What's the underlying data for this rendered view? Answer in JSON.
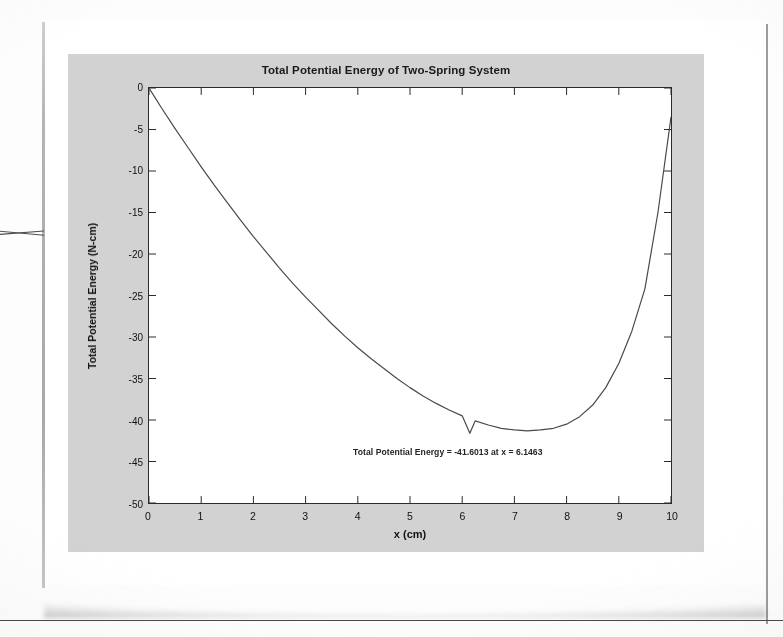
{
  "document": {
    "kind": "scanned-page-figure",
    "page_background": "#ffffff",
    "figure_background": "#d2d2d2",
    "axes_background": "#ffffff",
    "ink_color": "#2b2b2b"
  },
  "figure": {
    "title": "Total Potential Energy of Two-Spring System",
    "xlabel": "x (cm)",
    "ylabel": "Total Potential Energy (N-cm)",
    "annotation": "Total Potential Energy = -41.6013 at x = 6.1463"
  },
  "chart_data": {
    "type": "line",
    "title": "Total Potential Energy of Two-Spring System",
    "xlabel": "x (cm)",
    "ylabel": "Total Potential Energy (N-cm)",
    "xlim": [
      0,
      10
    ],
    "ylim": [
      -50,
      0
    ],
    "xticks": [
      0,
      1,
      2,
      3,
      4,
      5,
      6,
      7,
      8,
      9,
      10
    ],
    "xticklabels": [
      "0",
      "1",
      "2",
      "3",
      "4",
      "5",
      "6",
      "7",
      "8",
      "9",
      "10"
    ],
    "yticks": [
      0,
      -5,
      -10,
      -15,
      -20,
      -25,
      -30,
      -35,
      -40,
      -45,
      -50
    ],
    "yticklabels": [
      "0",
      "-5",
      "-10",
      "-15",
      "-20",
      "-25",
      "-30",
      "-35",
      "-40",
      "-45",
      "-50"
    ],
    "grid": false,
    "legend": null,
    "line_color": "#4a4a4a",
    "line_width": 1.1,
    "annotations": [
      {
        "text": "Total Potential Energy = -41.6013 at x = 6.1463",
        "x": 6.1463,
        "y": -43.6
      }
    ],
    "minimum": {
      "x": 6.1463,
      "y": -41.6013
    },
    "x": [
      0,
      0.25,
      0.5,
      0.75,
      1,
      1.25,
      1.5,
      1.75,
      2,
      2.25,
      2.5,
      2.75,
      3,
      3.25,
      3.5,
      3.75,
      4,
      4.25,
      4.5,
      4.75,
      5,
      5.25,
      5.5,
      5.75,
      6,
      6.1463,
      6.25,
      6.5,
      6.75,
      7,
      7.25,
      7.5,
      7.75,
      8,
      8.25,
      8.5,
      8.75,
      9,
      9.25,
      9.5,
      9.75,
      10
    ],
    "y": [
      0,
      -2.5,
      -4.9,
      -7.2,
      -9.5,
      -11.7,
      -13.8,
      -15.9,
      -17.9,
      -19.8,
      -21.7,
      -23.5,
      -25.2,
      -26.8,
      -28.4,
      -29.9,
      -31.3,
      -32.6,
      -33.8,
      -35.0,
      -36.1,
      -37.1,
      -38.0,
      -38.8,
      -39.5,
      -41.6,
      -40.1,
      -40.6,
      -41.0,
      -41.2,
      -41.3,
      -41.2,
      -41.0,
      -40.5,
      -39.6,
      -38.2,
      -36.1,
      -33.2,
      -29.3,
      -24.2,
      -15.0,
      -3.5
    ]
  }
}
